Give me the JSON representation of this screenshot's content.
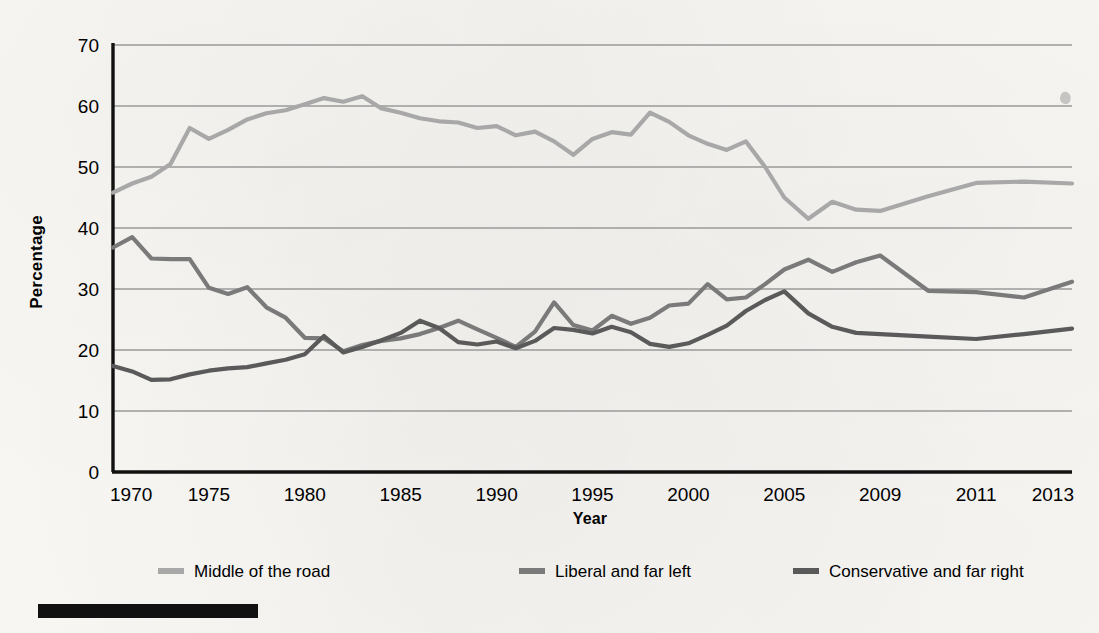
{
  "figure": {
    "ylabel": "Percentage",
    "xlabel": "Year",
    "y_ticks": [
      "0",
      "10",
      "20",
      "30",
      "40",
      "50",
      "60",
      "70"
    ],
    "x_ticks": [
      "1970",
      "1975",
      "1980",
      "1985",
      "1990",
      "1995",
      "2000",
      "2005",
      "2009",
      "2011",
      "2013"
    ]
  },
  "legend": {
    "items": [
      {
        "label": "Middle of the road",
        "color": "#a8a8a8"
      },
      {
        "label": "Liberal and far left",
        "color": "#7a7a7a"
      },
      {
        "label": "Conservative and far right",
        "color": "#5a5a5a"
      }
    ]
  },
  "colors": {
    "middle": "#a8a8a8",
    "liberal": "#7a7a7a",
    "conservative": "#5a5a5a",
    "grid": "#9a9a9a",
    "axis": "#111111",
    "paper": "#f6f5f2",
    "rule": "#111111"
  },
  "chart_data": {
    "type": "line",
    "title": "",
    "xlabel": "Year",
    "ylabel": "Percentage",
    "xlim": [
      1970,
      2013
    ],
    "ylim": [
      0,
      70
    ],
    "grid": true,
    "legend_position": "bottom",
    "x_tick_values": [
      1970,
      1975,
      1980,
      1985,
      1990,
      1995,
      2000,
      2005,
      2009,
      2011,
      2013
    ],
    "y_tick_values": [
      0,
      10,
      20,
      30,
      40,
      50,
      60,
      70
    ],
    "x": [
      1970,
      1971,
      1972,
      1973,
      1974,
      1975,
      1976,
      1977,
      1978,
      1979,
      1980,
      1981,
      1982,
      1983,
      1984,
      1985,
      1986,
      1987,
      1988,
      1989,
      1990,
      1991,
      1992,
      1993,
      1994,
      1995,
      1996,
      1997,
      1998,
      1999,
      2000,
      2001,
      2002,
      2003,
      2004,
      2005,
      2006,
      2007,
      2008,
      2009,
      2010,
      2011,
      2012,
      2013
    ],
    "series": [
      {
        "name": "Middle of the road",
        "color": "#a8a8a8",
        "values": [
          45.8,
          47.3,
          48.4,
          50.5,
          56.4,
          54.6,
          56.1,
          57.8,
          58.8,
          59.3,
          60.3,
          61.3,
          60.7,
          61.6,
          59.6,
          58.9,
          58.0,
          57.5,
          57.3,
          56.4,
          56.7,
          55.2,
          55.8,
          54.2,
          52.0,
          54.6,
          55.7,
          55.3,
          58.9,
          57.4,
          55.2,
          53.8,
          52.8,
          54.2,
          50.0,
          45.0,
          41.5,
          44.3,
          43.0,
          42.8,
          45.2,
          47.4,
          47.6,
          47.3
        ]
      },
      {
        "name": "Liberal and far left",
        "color": "#7a7a7a",
        "values": [
          36.8,
          38.5,
          35.0,
          34.9,
          34.9,
          30.2,
          29.2,
          30.3,
          27.0,
          25.3,
          22.0,
          21.9,
          19.8,
          20.8,
          21.5,
          21.9,
          22.6,
          23.6,
          24.8,
          23.4,
          22.0,
          20.5,
          23.0,
          27.8,
          24.1,
          23.2,
          25.6,
          24.3,
          25.3,
          27.3,
          27.6,
          30.8,
          28.3,
          28.6,
          30.8,
          33.2,
          34.8,
          32.8,
          34.4,
          35.5,
          29.7,
          29.5,
          28.6,
          31.2
        ]
      },
      {
        "name": "Conservative and far right",
        "color": "#5a5a5a",
        "values": [
          17.4,
          16.5,
          15.1,
          15.2,
          16.0,
          16.6,
          17.0,
          17.2,
          17.8,
          18.4,
          19.3,
          22.3,
          19.6,
          20.5,
          21.6,
          22.8,
          24.8,
          23.6,
          21.3,
          20.9,
          21.4,
          20.3,
          21.5,
          23.6,
          23.3,
          22.7,
          23.8,
          22.9,
          21.0,
          20.5,
          21.1,
          22.5,
          24.0,
          26.4,
          28.2,
          29.6,
          26.0,
          23.8,
          22.8,
          22.6,
          22.2,
          21.8,
          22.6,
          23.5
        ]
      }
    ]
  }
}
